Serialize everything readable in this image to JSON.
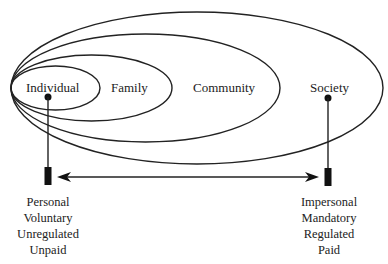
{
  "diagram": {
    "circles": [
      {
        "label": "Individual"
      },
      {
        "label": "Family"
      },
      {
        "label": "Community"
      },
      {
        "label": "Society"
      }
    ],
    "left_pole": [
      "Personal",
      "Voluntary",
      "Unregulated",
      "Unpaid"
    ],
    "right_pole": [
      "Impersonal",
      "Mandatory",
      "Regulated",
      "Paid"
    ],
    "line_color": "#222222"
  }
}
